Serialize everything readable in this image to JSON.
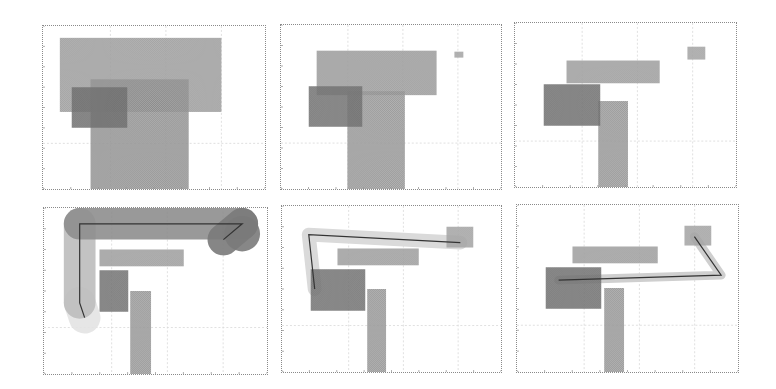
{
  "figure": {
    "layout": "2 rows x 3 columns",
    "panels": [
      {
        "id": "panel-1",
        "frame": {
          "x": 42,
          "y": 25,
          "w": 224,
          "h": 165
        },
        "obstacles": [
          {
            "name": "large-block",
            "x": 17,
            "y": 12,
            "w": 163,
            "h": 75,
            "color": "#aaaaaa"
          },
          {
            "name": "tall-block",
            "x": 48,
            "y": 54,
            "w": 99,
            "h": 111,
            "color": "#a0a0a0"
          },
          {
            "name": "dark-block",
            "x": 29,
            "y": 62,
            "w": 56,
            "h": 41,
            "color": "#7a7a7a"
          }
        ],
        "path": null
      },
      {
        "id": "panel-2",
        "frame": {
          "x": 280,
          "y": 24,
          "w": 222,
          "h": 166
        },
        "obstacles": [
          {
            "name": "horizontal-block",
            "x": 36,
            "y": 26,
            "w": 121,
            "h": 45,
            "color": "#a8a8a8"
          },
          {
            "name": "tall-block",
            "x": 67,
            "y": 67,
            "w": 58,
            "h": 99,
            "color": "#a4a4a4"
          },
          {
            "name": "dark-block",
            "x": 28,
            "y": 62,
            "w": 54,
            "h": 41,
            "color": "#7c7c7c"
          },
          {
            "name": "small-block",
            "x": 175,
            "y": 27,
            "w": 9,
            "h": 6,
            "color": "#b0b0b0"
          }
        ],
        "path": null
      },
      {
        "id": "panel-3",
        "frame": {
          "x": 514,
          "y": 22,
          "w": 223,
          "h": 166
        },
        "obstacles": [
          {
            "name": "small-block",
            "x": 174,
            "y": 24,
            "w": 18,
            "h": 13,
            "color": "#b0b0b0"
          },
          {
            "name": "horizontal-block",
            "x": 52,
            "y": 38,
            "w": 94,
            "h": 23,
            "color": "#aaaaaa"
          },
          {
            "name": "tall-block",
            "x": 84,
            "y": 79,
            "w": 30,
            "h": 87,
            "color": "#a4a4a4"
          },
          {
            "name": "dark-block",
            "x": 29,
            "y": 62,
            "w": 57,
            "h": 42,
            "color": "#7a7a7a"
          }
        ],
        "path": null
      },
      {
        "id": "panel-4",
        "frame": {
          "x": 43,
          "y": 207,
          "w": 225,
          "h": 168
        },
        "obstacles": [
          {
            "name": "horizontal-block",
            "x": 56,
            "y": 42,
            "w": 85,
            "h": 17,
            "color": "#aaaaaa"
          },
          {
            "name": "dark-block",
            "x": 56,
            "y": 63,
            "w": 29,
            "h": 42,
            "color": "#7c7c7c"
          },
          {
            "name": "tall-block",
            "x": 87,
            "y": 84,
            "w": 21,
            "h": 84,
            "color": "#a4a4a4"
          }
        ],
        "path": {
          "points": [
            [
              41,
              111
            ],
            [
              36,
              96
            ],
            [
              36,
              16
            ],
            [
              200,
              16
            ],
            [
              181,
              32
            ]
          ],
          "swept_width": 32,
          "swept_colors": [
            "#e4e4e4",
            "#bdbdbd",
            "#8e8e8e",
            "#7a7a7a"
          ]
        }
      },
      {
        "id": "panel-5",
        "frame": {
          "x": 281,
          "y": 205,
          "w": 221,
          "h": 168
        },
        "obstacles": [
          {
            "name": "horizontal-block",
            "x": 56,
            "y": 43,
            "w": 82,
            "h": 17,
            "color": "#aaaaaa"
          },
          {
            "name": "dark-block",
            "x": 29,
            "y": 64,
            "w": 55,
            "h": 42,
            "color": "#7c7c7c"
          },
          {
            "name": "tall-block",
            "x": 86,
            "y": 84,
            "w": 19,
            "h": 84,
            "color": "#a4a4a4"
          },
          {
            "name": "small-block",
            "x": 166,
            "y": 21,
            "w": 27,
            "h": 21,
            "color": "#b0b0b0"
          }
        ],
        "path": {
          "points": [
            [
              33,
              84
            ],
            [
              27,
              29
            ],
            [
              180,
              37
            ]
          ],
          "swept_width": 14,
          "swept_colors": [
            "#dadada"
          ]
        }
      },
      {
        "id": "panel-6",
        "frame": {
          "x": 516,
          "y": 204,
          "w": 223,
          "h": 169
        },
        "obstacles": [
          {
            "name": "small-block",
            "x": 169,
            "y": 21,
            "w": 27,
            "h": 20,
            "color": "#b0b0b0"
          },
          {
            "name": "horizontal-block",
            "x": 56,
            "y": 42,
            "w": 86,
            "h": 17,
            "color": "#aaaaaa"
          },
          {
            "name": "dark-block",
            "x": 29,
            "y": 63,
            "w": 56,
            "h": 42,
            "color": "#7a7a7a"
          },
          {
            "name": "tall-block",
            "x": 88,
            "y": 84,
            "w": 20,
            "h": 85,
            "color": "#a4a4a4"
          }
        ],
        "path": {
          "points": [
            [
              179,
              32
            ],
            [
              206,
              71
            ],
            [
              42,
              76
            ]
          ],
          "swept_width": 9,
          "swept_colors": [
            "#cfcfcf"
          ]
        }
      }
    ]
  },
  "colors": {
    "frame": "#8a8a8a",
    "grid": "#d8d8d8",
    "path_line": "#333333"
  }
}
